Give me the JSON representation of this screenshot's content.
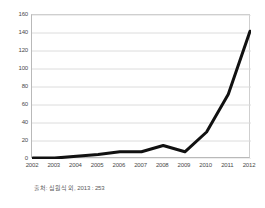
{
  "chart_data": {
    "type": "line",
    "title": "",
    "subtitle": "",
    "xlabel": "",
    "ylabel": "",
    "categories": [
      "2002",
      "2003",
      "2004",
      "2005",
      "2006",
      "2007",
      "2008",
      "2009",
      "2010",
      "2011",
      "2012"
    ],
    "x": [
      2002,
      2003,
      2004,
      2005,
      2006,
      2007,
      2008,
      2009,
      2010,
      2011,
      2012
    ],
    "values": [
      1,
      1,
      3,
      5,
      8,
      8,
      15,
      8,
      30,
      72,
      142
    ],
    "series": [
      {
        "name": "",
        "values": [
          1,
          1,
          3,
          5,
          8,
          8,
          15,
          8,
          30,
          72,
          142
        ],
        "color": "#111111",
        "line_width": 3
      }
    ],
    "ylim": [
      0,
      160
    ],
    "xlim": [
      2002,
      2012
    ],
    "yticks": [
      0,
      20,
      40,
      60,
      80,
      100,
      120,
      140,
      160
    ],
    "ytick_labels": [
      "0",
      "20",
      "40",
      "60",
      "80",
      "100",
      "120",
      "140",
      "160"
    ],
    "xtick_labels": [
      "2002",
      "2003",
      "2004",
      "2005",
      "2006",
      "2007",
      "2008",
      "2009",
      "2010",
      "2011",
      "2012"
    ],
    "grid": true,
    "grid_axis": "y",
    "grid_color": "#dcdcdc",
    "legend": false,
    "legend_position": "none",
    "plot_background": "#ffffff",
    "frame_color": "#b9b9b9",
    "annotations": []
  },
  "caption": {
    "text": "출처: 심원식 외, 2013 : 253"
  }
}
